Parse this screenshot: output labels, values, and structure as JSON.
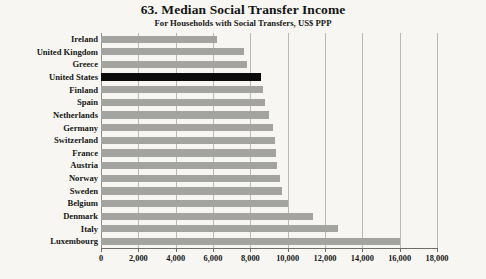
{
  "chart_data": {
    "type": "bar",
    "orientation": "horizontal",
    "title": "63. Median Social Transfer Income",
    "subtitle": "For Households with Social Transfers, US$ PPP",
    "xlabel": "",
    "ylabel": "",
    "xlim": [
      0,
      18000
    ],
    "xticks": [
      0,
      2000,
      4000,
      6000,
      8000,
      10000,
      12000,
      14000,
      16000,
      18000
    ],
    "xtick_labels": [
      "0",
      "2,000",
      "4,000",
      "6,000",
      "8,000",
      "10,000",
      "12,000",
      "14,000",
      "16,000",
      "18,000"
    ],
    "grid": true,
    "grid_axis": "x",
    "legend": false,
    "categories": [
      "Ireland",
      "United Kingdom",
      "Greece",
      "United States",
      "Finland",
      "Spain",
      "Netherlands",
      "Germany",
      "Switzerland",
      "France",
      "Austria",
      "Norway",
      "Sweden",
      "Belgium",
      "Denmark",
      "Italy",
      "Luxembourg"
    ],
    "values": [
      6200,
      7650,
      7800,
      8550,
      8700,
      8800,
      9000,
      9200,
      9300,
      9400,
      9450,
      9600,
      9700,
      10000,
      11350,
      12700,
      16000
    ],
    "highlight_category": "United States",
    "colors": {
      "bar": "#a3a3a0",
      "highlight_bar": "#0b0b0b",
      "gridline": "#b9b9b4",
      "axis": "#6f6f6a",
      "background": "#f7f6f2",
      "text": "#161616"
    }
  }
}
